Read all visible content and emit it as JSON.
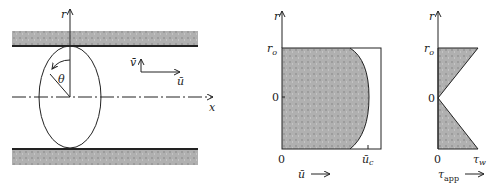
{
  "figure": {
    "panel_flow": {
      "axis_r": "r",
      "axis_x": "x",
      "angle": "θ",
      "velocity_v": "v̄",
      "velocity_u": "ū"
    },
    "panel_velocity": {
      "axis_r": "r",
      "tick_ro": "r",
      "tick_ro_sub": "o",
      "tick_zero_mid": "0",
      "tick_zero_origin": "0",
      "tick_uc": "ū",
      "tick_uc_sub": "c",
      "xlabel": "ū",
      "xlabel_arrow": "⟶"
    },
    "panel_stress": {
      "axis_r": "r",
      "tick_ro": "r",
      "tick_ro_sub": "o",
      "tick_zero_mid": "0",
      "tick_zero_origin": "0",
      "tick_tw": "τ",
      "tick_tw_sub": "w",
      "xlabel": "τ",
      "xlabel_sub": "app",
      "xlabel_arrow": "⟶"
    },
    "colors": {
      "line": "#222222",
      "shade": "#a8a8a8",
      "wall_shade": "#b5b5b5"
    }
  }
}
